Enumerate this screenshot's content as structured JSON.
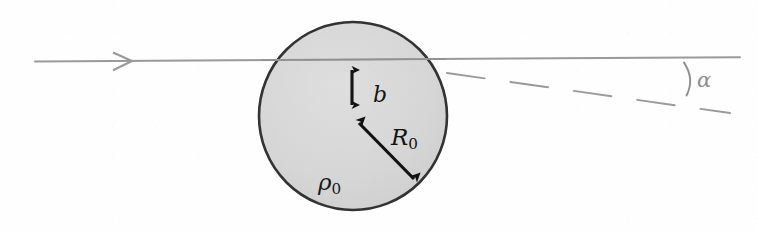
{
  "figure": {
    "domain": "Diagram",
    "kind": "scattering-geometry-diagram",
    "background_color": "#fefefe"
  },
  "sphere": {
    "name": "uniform-sphere",
    "center_x": 353,
    "center_y": 116,
    "radius": 94,
    "fill_color": "#d6d6d6",
    "stroke_color": "#333333",
    "stroke_width": 2.6,
    "density_label": "ρ",
    "density_subscript": "0"
  },
  "incoming_ray": {
    "name": "incoming-trajectory",
    "label": "",
    "color": "#9a9a9a",
    "stroke_width": 2.0,
    "x_start": 35,
    "x_end": 740,
    "y_left": 61,
    "y_right": 57,
    "arrowhead_x": 130,
    "arrowhead_style": "open-chevron"
  },
  "impact_parameter": {
    "name": "impact-parameter-arrow",
    "label": "b",
    "subscript": "",
    "color": "#131313",
    "x": 352,
    "y_top": 62,
    "y_bottom": 113,
    "double_headed": true
  },
  "radius_arrow": {
    "name": "radius-arrow",
    "label": "R",
    "subscript": "0",
    "color": "#121212",
    "x_start": 352,
    "y_start": 116,
    "x_end": 421,
    "y_end": 186,
    "double_headed": true
  },
  "deflected_ray": {
    "name": "deflected-trajectory-dashed",
    "color": "#9a9a9a",
    "stroke_width": 1.9,
    "dash_pattern": "long-dash",
    "x_start": 447,
    "y_start": 72,
    "x_end": 727,
    "y_end": 112
  },
  "angle": {
    "name": "deflection-angle",
    "label": "α",
    "color": "#8e8e8e",
    "vertex_x": 740,
    "vertex_y": 57,
    "arc_color": "#8e8e8e",
    "value_degrees": 8
  },
  "labels": {
    "b": "b",
    "R": "R",
    "R_sub": "0",
    "rho": "ρ",
    "rho_sub": "0",
    "alpha": "α"
  }
}
